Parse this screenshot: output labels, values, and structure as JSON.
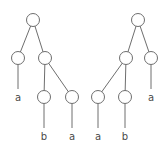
{
  "diagram": {
    "type": "parse-trees",
    "node_radius": 6.5,
    "colors": {
      "stroke": "#6e6e6e",
      "label": "#4a4a4a",
      "background": "#ffffff"
    },
    "trees": [
      {
        "name": "left-tree",
        "nodes": [
          {
            "id": "L0",
            "x": 33,
            "y": 20
          },
          {
            "id": "L1",
            "x": 18,
            "y": 58
          },
          {
            "id": "L2",
            "x": 45,
            "y": 58
          },
          {
            "id": "L3",
            "x": 44,
            "y": 97
          },
          {
            "id": "L4",
            "x": 72,
            "y": 97
          }
        ],
        "edges": [
          {
            "from": "L0",
            "to": "L1"
          },
          {
            "from": "L0",
            "to": "L2"
          },
          {
            "from": "L2",
            "to": "L3"
          },
          {
            "from": "L2",
            "to": "L4"
          }
        ],
        "leaves": [
          {
            "parent": "L1",
            "label": "a",
            "x": 18,
            "y": 101
          },
          {
            "parent": "L3",
            "label": "b",
            "x": 44,
            "y": 140
          },
          {
            "parent": "L4",
            "label": "a",
            "x": 72,
            "y": 140
          }
        ]
      },
      {
        "name": "right-tree",
        "nodes": [
          {
            "id": "R0",
            "x": 138,
            "y": 20
          },
          {
            "id": "R1",
            "x": 126,
            "y": 58
          },
          {
            "id": "R2",
            "x": 151,
            "y": 58
          },
          {
            "id": "R3",
            "x": 98,
            "y": 97
          },
          {
            "id": "R4",
            "x": 125,
            "y": 97
          }
        ],
        "edges": [
          {
            "from": "R0",
            "to": "R1"
          },
          {
            "from": "R0",
            "to": "R2"
          },
          {
            "from": "R1",
            "to": "R3"
          },
          {
            "from": "R1",
            "to": "R4"
          }
        ],
        "leaves": [
          {
            "parent": "R2",
            "label": "a",
            "x": 151,
            "y": 101
          },
          {
            "parent": "R3",
            "label": "a",
            "x": 98,
            "y": 140
          },
          {
            "parent": "R4",
            "label": "b",
            "x": 125,
            "y": 140
          }
        ]
      }
    ]
  }
}
